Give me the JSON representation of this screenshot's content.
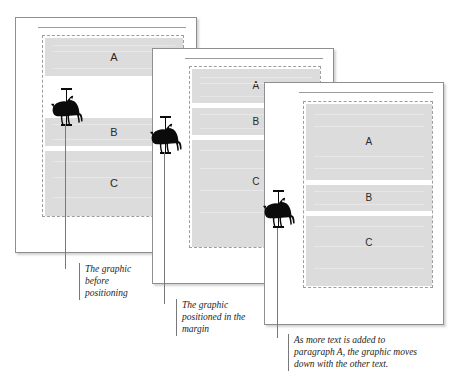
{
  "figure": {
    "colors": {
      "paragraph_fill": "#dcdcdc",
      "page_border": "#8e8e8e",
      "frame_dash": "#9d9d9d",
      "leader_line": "#787878",
      "caption_text": "#1d1d1d",
      "page_background": "#ffffff",
      "canvas_background": "#ffffff"
    },
    "graphic_name": "carousel-horse"
  },
  "pages": [
    {
      "id": "page-1",
      "paragraphs": [
        {
          "label": "A"
        },
        {
          "label": "B"
        },
        {
          "label": "C"
        }
      ],
      "graphic_position": "inline-in-text-flow"
    },
    {
      "id": "page-2",
      "paragraphs": [
        {
          "label": "A"
        },
        {
          "label": "B"
        },
        {
          "label": "C"
        }
      ],
      "graphic_position": "in-left-margin"
    },
    {
      "id": "page-3",
      "paragraphs": [
        {
          "label": "A"
        },
        {
          "label": "B"
        },
        {
          "label": "C"
        }
      ],
      "graphic_position": "in-left-margin-moved-down"
    }
  ],
  "captions": [
    {
      "id": "caption-1",
      "text": "The graphic\nbefore\npositioning"
    },
    {
      "id": "caption-2",
      "text": "The graphic\npositioned in the\nmargin"
    },
    {
      "id": "caption-3",
      "text": "As more text is added to\nparagraph A, the graphic moves\ndown with the other text."
    }
  ]
}
